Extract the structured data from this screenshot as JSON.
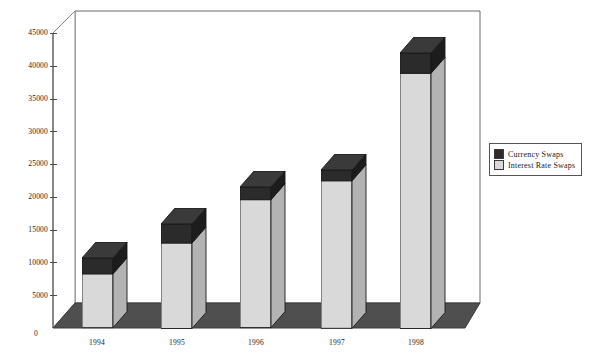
{
  "chart_data": {
    "type": "bar",
    "subtype": "stacked-3d-column",
    "title": "",
    "xlabel": "",
    "ylabel": "",
    "categories": [
      "1994",
      "1995",
      "1996",
      "1997",
      "1998"
    ],
    "series": [
      {
        "name": "Interest Rate Swaps",
        "color": "#d9d9d9",
        "values": [
          8500,
          13500,
          20200,
          23300,
          40300
        ]
      },
      {
        "name": "Currency Swaps",
        "color": "#2b2b2b",
        "values": [
          2500,
          3000,
          2000,
          1700,
          3200
        ]
      }
    ],
    "totals": [
      11000,
      16500,
      22200,
      25000,
      43500
    ],
    "ylim": [
      0,
      45000
    ],
    "yticks": [
      0,
      5000,
      10000,
      15000,
      20000,
      25000,
      30000,
      35000,
      40000,
      45000
    ],
    "ytick_labels": [
      "0",
      "5000",
      "10000",
      "15000",
      "20000",
      "25000",
      "30000",
      "35000",
      "40000",
      "45000"
    ],
    "grid": false,
    "legend_position": "right"
  },
  "legend": {
    "items": [
      {
        "label": "Currency Swaps",
        "color": "#2b2b2b"
      },
      {
        "label": "Interest Rate Swaps",
        "color": "#d9d9d9"
      }
    ]
  },
  "colors": {
    "currency_swaps": "#2b2b2b",
    "interest_rate_swaps": "#d9d9d9",
    "floor": "#4f4f4f",
    "wall_line": "#6b6b6b",
    "bar_side": "#b3b3b3",
    "bar_side_dark": "#1c1c1c"
  }
}
